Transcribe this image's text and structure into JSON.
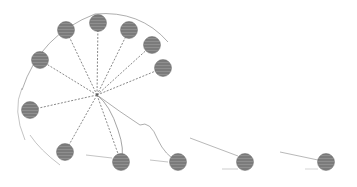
{
  "illustration": {
    "description": "sketch of motion-blurred gray spheres on lines radiating from a hub",
    "hub": {
      "x": 97,
      "y": 95
    },
    "ball_color": "#8a8a8a",
    "line_color": "#555555",
    "balls": [
      {
        "x": 40,
        "y": 60
      },
      {
        "x": 66,
        "y": 30
      },
      {
        "x": 98,
        "y": 23
      },
      {
        "x": 129,
        "y": 30
      },
      {
        "x": 152,
        "y": 45
      },
      {
        "x": 163,
        "y": 68
      },
      {
        "x": 30,
        "y": 110
      },
      {
        "x": 65,
        "y": 152
      },
      {
        "x": 121,
        "y": 162
      },
      {
        "x": 178,
        "y": 162
      },
      {
        "x": 245,
        "y": 162
      },
      {
        "x": 326,
        "y": 162
      }
    ]
  }
}
